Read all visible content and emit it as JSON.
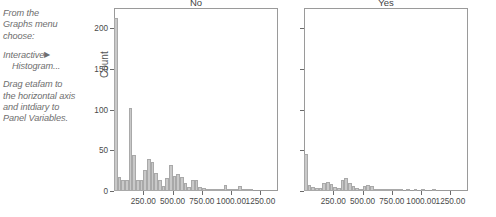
{
  "instructions": {
    "line1": "From the",
    "line2": "Graphs menu",
    "line3": "choose:",
    "menu_item": "Interactive",
    "arrow": "▶",
    "submenu_item": "Histogram...",
    "drag1": "Drag etafam to",
    "drag2": "the horizontal axis",
    "drag3": "and intdiary to",
    "drag4": "Panel Variables."
  },
  "chart_data": {
    "type": "bar",
    "title": "",
    "xlabel": "",
    "ylabel": "Count",
    "ylim": [
      0,
      225
    ],
    "xlim": [
      0,
      1400
    ],
    "grid": false,
    "legend": "none",
    "panel_variable": "intdiary",
    "x_variable": "etafam",
    "xticks": [
      250,
      500,
      750,
      1000,
      1250
    ],
    "xticklabels": [
      "250.00",
      "500.00",
      "750.00",
      "1000.00",
      "1250.00"
    ],
    "yticks": [
      0,
      50,
      100,
      150,
      200
    ],
    "yticklabels": [
      "0",
      "50",
      "100",
      "150",
      "200"
    ],
    "bar_color": "#c9c9c9",
    "bar_edge_color": "#a9a9a9",
    "bin_width": 31.25,
    "panels": [
      {
        "label": "No",
        "show_y_labels": true,
        "bins": [
          {
            "x": 15.6,
            "count": 213
          },
          {
            "x": 46.9,
            "count": 17
          },
          {
            "x": 78.1,
            "count": 13
          },
          {
            "x": 109.4,
            "count": 13
          },
          {
            "x": 140.6,
            "count": 102
          },
          {
            "x": 171.9,
            "count": 44
          },
          {
            "x": 203.1,
            "count": 14
          },
          {
            "x": 234.4,
            "count": 13
          },
          {
            "x": 265.6,
            "count": 26
          },
          {
            "x": 296.9,
            "count": 39
          },
          {
            "x": 328.1,
            "count": 36
          },
          {
            "x": 359.4,
            "count": 22
          },
          {
            "x": 390.6,
            "count": 13
          },
          {
            "x": 421.9,
            "count": 6
          },
          {
            "x": 453.1,
            "count": 16
          },
          {
            "x": 484.4,
            "count": 32
          },
          {
            "x": 515.6,
            "count": 18
          },
          {
            "x": 546.9,
            "count": 21
          },
          {
            "x": 578.1,
            "count": 17
          },
          {
            "x": 609.4,
            "count": 10
          },
          {
            "x": 640.6,
            "count": 5
          },
          {
            "x": 671.9,
            "count": 13
          },
          {
            "x": 703.1,
            "count": 13
          },
          {
            "x": 734.4,
            "count": 5
          },
          {
            "x": 765.6,
            "count": 4
          },
          {
            "x": 796.9,
            "count": 3
          },
          {
            "x": 828.1,
            "count": 2
          },
          {
            "x": 859.4,
            "count": 2
          },
          {
            "x": 890.6,
            "count": 1
          },
          {
            "x": 921.9,
            "count": 1
          },
          {
            "x": 953.1,
            "count": 8
          },
          {
            "x": 984.4,
            "count": 2
          },
          {
            "x": 1015.6,
            "count": 1
          },
          {
            "x": 1046.9,
            "count": 1
          },
          {
            "x": 1078.1,
            "count": 6
          },
          {
            "x": 1109.4,
            "count": 2
          },
          {
            "x": 1140.6,
            "count": 1
          },
          {
            "x": 1171.9,
            "count": 1
          }
        ]
      },
      {
        "label": "Yes",
        "show_y_labels": false,
        "bins": [
          {
            "x": 15.6,
            "count": 46
          },
          {
            "x": 46.9,
            "count": 7
          },
          {
            "x": 78.1,
            "count": 5
          },
          {
            "x": 109.4,
            "count": 4
          },
          {
            "x": 140.6,
            "count": 4
          },
          {
            "x": 171.9,
            "count": 10
          },
          {
            "x": 203.1,
            "count": 11
          },
          {
            "x": 234.4,
            "count": 9
          },
          {
            "x": 265.6,
            "count": 5
          },
          {
            "x": 296.9,
            "count": 4
          },
          {
            "x": 328.1,
            "count": 14
          },
          {
            "x": 359.4,
            "count": 16
          },
          {
            "x": 390.6,
            "count": 10
          },
          {
            "x": 421.9,
            "count": 6
          },
          {
            "x": 453.1,
            "count": 4
          },
          {
            "x": 484.4,
            "count": 3
          },
          {
            "x": 515.6,
            "count": 6
          },
          {
            "x": 546.9,
            "count": 7
          },
          {
            "x": 578.1,
            "count": 6
          },
          {
            "x": 609.4,
            "count": 3
          },
          {
            "x": 640.6,
            "count": 2
          },
          {
            "x": 671.9,
            "count": 2
          },
          {
            "x": 703.1,
            "count": 1
          },
          {
            "x": 734.4,
            "count": 1
          },
          {
            "x": 765.6,
            "count": 1
          },
          {
            "x": 796.9,
            "count": 1
          },
          {
            "x": 828.1,
            "count": 1
          },
          {
            "x": 890.6,
            "count": 1
          },
          {
            "x": 953.1,
            "count": 1
          },
          {
            "x": 1015.6,
            "count": 1
          },
          {
            "x": 1109.4,
            "count": 1
          }
        ]
      }
    ]
  }
}
